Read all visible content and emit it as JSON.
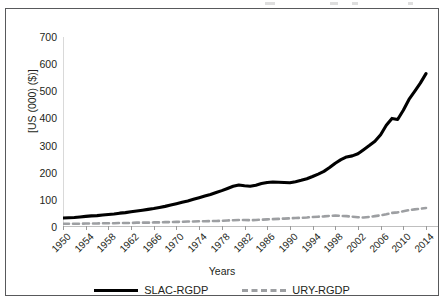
{
  "figure": {
    "y_axis_label": "[US (000) ($)]",
    "x_axis_title": "Years",
    "y_ticks": [
      "0",
      "100",
      "200",
      "300",
      "400",
      "500",
      "600",
      "700"
    ],
    "x_ticks": [
      "1950",
      "1954",
      "1958",
      "1962",
      "1966",
      "1970",
      "1974",
      "1978",
      "1982",
      "1986",
      "1990",
      "1994",
      "1998",
      "2002",
      "2006",
      "2010",
      "2014"
    ],
    "legend": [
      {
        "label": "SLAC-RGDP",
        "style": "solid",
        "color": "#000000"
      },
      {
        "label": "URY-RGDP",
        "style": "dashed",
        "color": "#9d9fa2"
      }
    ]
  },
  "chart_data": {
    "type": "line",
    "title": "",
    "xlabel": "Years",
    "ylabel": "[US (000) ($)]",
    "xlim": [
      1950,
      2015
    ],
    "ylim": [
      0,
      700
    ],
    "grid": false,
    "legend_position": "bottom-center",
    "tick_interval_x": 4,
    "tick_interval_y": 100,
    "x": [
      1950,
      1951,
      1952,
      1953,
      1954,
      1955,
      1956,
      1957,
      1958,
      1959,
      1960,
      1961,
      1962,
      1963,
      1964,
      1965,
      1966,
      1967,
      1968,
      1969,
      1970,
      1971,
      1972,
      1973,
      1974,
      1975,
      1976,
      1977,
      1978,
      1979,
      1980,
      1981,
      1982,
      1983,
      1984,
      1985,
      1986,
      1987,
      1988,
      1989,
      1990,
      1991,
      1992,
      1993,
      1994,
      1995,
      1996,
      1997,
      1998,
      1999,
      2000,
      2001,
      2002,
      2003,
      2004,
      2005,
      2006,
      2007,
      2008,
      2009,
      2010,
      2011,
      2012,
      2013,
      2014
    ],
    "series": [
      {
        "name": "SLAC-RGDP",
        "color": "#000000",
        "style": "solid",
        "values": [
          33,
          34,
          35,
          37,
          39,
          41,
          42,
          44,
          46,
          48,
          51,
          53,
          56,
          59,
          62,
          65,
          68,
          72,
          76,
          81,
          86,
          91,
          96,
          102,
          108,
          114,
          120,
          127,
          134,
          142,
          150,
          155,
          152,
          150,
          154,
          160,
          164,
          166,
          165,
          164,
          163,
          167,
          172,
          178,
          186,
          195,
          205,
          219,
          235,
          248,
          258,
          262,
          270,
          285,
          300,
          316,
          340,
          375,
          400,
          396,
          430,
          470,
          500,
          530,
          565
        ],
        "annual_approx": true
      },
      {
        "name": "URY-RGDP",
        "color": "#9d9fa2",
        "style": "dashed",
        "values": [
          12,
          12,
          12,
          12,
          13,
          13,
          13,
          14,
          14,
          14,
          15,
          15,
          15,
          16,
          16,
          16,
          17,
          17,
          18,
          18,
          19,
          19,
          20,
          20,
          21,
          21,
          22,
          22,
          23,
          24,
          25,
          26,
          26,
          25,
          26,
          27,
          28,
          29,
          30,
          31,
          32,
          33,
          34,
          35,
          37,
          38,
          39,
          41,
          42,
          41,
          40,
          38,
          36,
          35,
          37,
          40,
          43,
          47,
          52,
          54,
          58,
          62,
          65,
          67,
          70
        ],
        "annual_approx": true
      }
    ]
  }
}
